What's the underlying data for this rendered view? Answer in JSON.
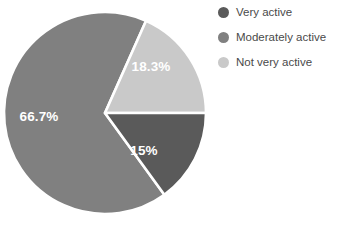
{
  "chart_data": {
    "type": "pie",
    "title": "",
    "subtitle": "",
    "xlabel": "",
    "ylabel": "",
    "grid": false,
    "legend_position": "right",
    "categories": [
      "Very active",
      "Moderately active",
      "Not very active"
    ],
    "values": [
      15,
      66.7,
      18.3
    ],
    "value_labels": [
      "15%",
      "66.7%",
      "18.3%"
    ],
    "colors": [
      "#5a5a5a",
      "#808080",
      "#c9c9c9"
    ],
    "slices": [
      {
        "name": "Very active",
        "value": 15,
        "label": "15%",
        "color": "#5a5a5a",
        "start_angle": 90,
        "end_angle": 144,
        "label_x": 144,
        "label_y": 151
      },
      {
        "name": "Moderately active",
        "value": 66.7,
        "label": "66.7%",
        "color": "#808080",
        "start_angle": 144,
        "end_angle": 384,
        "label_x": 39,
        "label_y": 117
      },
      {
        "name": "Not very active",
        "value": 18.3,
        "label": "18.3%",
        "color": "#c9c9c9",
        "start_angle": 24,
        "end_angle": 90,
        "label_x": 151,
        "label_y": 67
      }
    ]
  },
  "legend": {
    "items": [
      {
        "label": "Very active",
        "color": "#5a5a5a",
        "swatch": "circle-swatch"
      },
      {
        "label": "Moderately active",
        "color": "#808080",
        "swatch": "circle-swatch"
      },
      {
        "label": "Not very active",
        "color": "#c9c9c9",
        "swatch": "circle-swatch"
      }
    ]
  },
  "canvas": {
    "background": "#ffffff",
    "separator_color": "#ffffff",
    "label_text_color": "#ffffff",
    "legend_text_color": "#4a4a4a"
  }
}
